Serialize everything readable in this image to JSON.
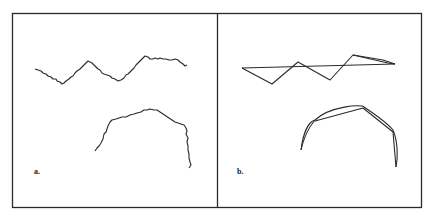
{
  "figure": {
    "panels": [
      {
        "id": "a",
        "label": "a.",
        "description": "Wiggly curves (original line detail)",
        "curves": [
          "wavy horizontal curve",
          "wavy arc curve"
        ]
      },
      {
        "id": "b",
        "label": "b.",
        "description": "Simplified polygonal approximations with baseline chord and arc",
        "curves": [
          "zig-zag polyline with horizontal chord",
          "smooth arc with chord segments"
        ]
      }
    ],
    "colors": {
      "stroke": "#2a2a2a",
      "frame": "#2a2a2a",
      "background": "#ffffff"
    }
  }
}
